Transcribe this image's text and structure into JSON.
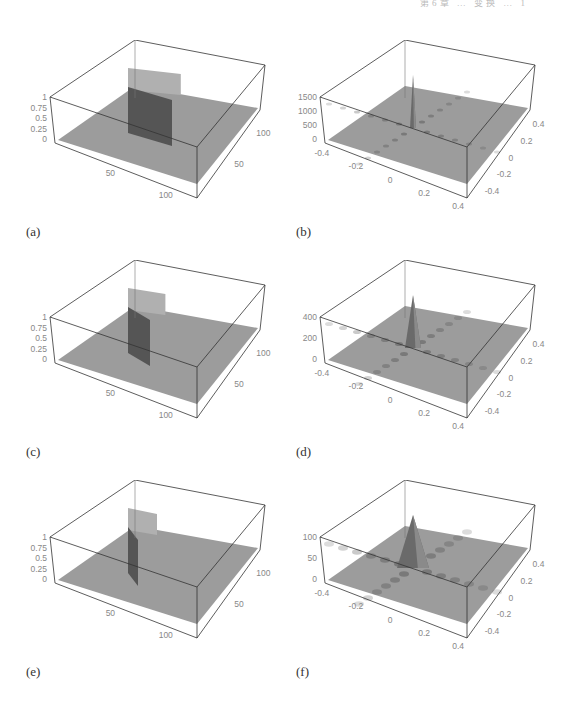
{
  "page": {
    "running_head": "第6章 … 变换 … 1"
  },
  "panels": [
    {
      "id": "a",
      "caption": "(a)",
      "kind": "rect",
      "zlabels": [
        "1",
        "0.75",
        "0.5",
        "0.25",
        "0"
      ],
      "xlabels": [
        "50",
        "100"
      ],
      "ylabels": [
        "50",
        "100"
      ]
    },
    {
      "id": "b",
      "caption": "(b)",
      "kind": "spectrum",
      "zlabels": [
        "1500",
        "1000",
        "500",
        "0"
      ],
      "xlabels": [
        "-0.4",
        "-0.2",
        "0",
        "0.2",
        "0.4"
      ],
      "ylabels": [
        "0.4",
        "0.2",
        "0",
        "-0.2",
        "-0.4"
      ]
    },
    {
      "id": "c",
      "caption": "(c)",
      "kind": "rect",
      "zlabels": [
        "1",
        "0.75",
        "0.5",
        "0.25",
        "0"
      ],
      "xlabels": [
        "50",
        "100"
      ],
      "ylabels": [
        "50",
        "100"
      ]
    },
    {
      "id": "d",
      "caption": "(d)",
      "kind": "spectrum",
      "zlabels": [
        "400",
        "200",
        "0"
      ],
      "xlabels": [
        "-0.4",
        "-0.2",
        "0",
        "0.2",
        "0.4"
      ],
      "ylabels": [
        "0.4",
        "0.2",
        "0",
        "-0.2",
        "-0.4"
      ]
    },
    {
      "id": "e",
      "caption": "(e)",
      "kind": "rect",
      "zlabels": [
        "1",
        "0.75",
        "0.5",
        "0.25",
        "0"
      ],
      "xlabels": [
        "50",
        "100"
      ],
      "ylabels": [
        "50",
        "100"
      ]
    },
    {
      "id": "f",
      "caption": "(f)",
      "kind": "spectrum",
      "zlabels": [
        "100",
        "50",
        "0"
      ],
      "xlabels": [
        "-0.4",
        "-0.2",
        "0",
        "0.2",
        "0.4"
      ],
      "ylabels": [
        "0.4",
        "0.2",
        "0",
        "-0.2",
        "-0.4"
      ]
    }
  ],
  "chart_data": [
    {
      "type": "surface",
      "title": "(a)",
      "description": "Rectangular pulse of height 1 on a 128x128 grid (wide rectangle)",
      "zlim": [
        0,
        1
      ],
      "xticks": [
        50,
        100
      ],
      "yticks": [
        50,
        100
      ],
      "zticks": [
        0,
        0.25,
        0.5,
        0.75,
        1
      ]
    },
    {
      "type": "surface",
      "title": "(b)",
      "description": "Fourier magnitude spectrum of (a): sharp central peak with sinc cross pattern",
      "zlim": [
        0,
        1500
      ],
      "xticks": [
        -0.4,
        -0.2,
        0,
        0.2,
        0.4
      ],
      "yticks": [
        -0.4,
        -0.2,
        0,
        0.2,
        0.4
      ],
      "zticks": [
        0,
        500,
        1000,
        1500
      ]
    },
    {
      "type": "surface",
      "title": "(c)",
      "description": "Narrower rectangular pulse of height 1",
      "zlim": [
        0,
        1
      ],
      "xticks": [
        50,
        100
      ],
      "yticks": [
        50,
        100
      ],
      "zticks": [
        0,
        0.25,
        0.5,
        0.75,
        1
      ]
    },
    {
      "type": "surface",
      "title": "(d)",
      "description": "Fourier magnitude spectrum of (c): broader central peak",
      "zlim": [
        0,
        400
      ],
      "xticks": [
        -0.4,
        -0.2,
        0,
        0.2,
        0.4
      ],
      "yticks": [
        -0.4,
        -0.2,
        0,
        0.2,
        0.4
      ],
      "zticks": [
        0,
        200,
        400
      ]
    },
    {
      "type": "surface",
      "title": "(e)",
      "description": "Narrowest rectangular pulse of height 1",
      "zlim": [
        0,
        1
      ],
      "xticks": [
        50,
        100
      ],
      "yticks": [
        50,
        100
      ],
      "zticks": [
        0,
        0.25,
        0.5,
        0.75,
        1
      ]
    },
    {
      "type": "surface",
      "title": "(f)",
      "description": "Fourier magnitude spectrum of (e): broad central lobe with side lobes",
      "zlim": [
        0,
        100
      ],
      "xticks": [
        -0.4,
        -0.2,
        0,
        0.2,
        0.4
      ],
      "yticks": [
        -0.4,
        -0.2,
        0,
        0.2,
        0.4
      ],
      "zticks": [
        0,
        50,
        100
      ]
    }
  ]
}
